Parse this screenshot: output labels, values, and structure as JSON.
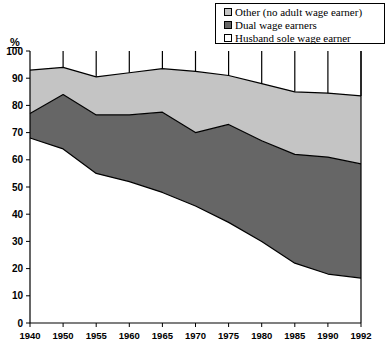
{
  "chart_data": {
    "type": "area",
    "stacked": true,
    "title": "",
    "xlabel": "",
    "ylabel": "%",
    "ylim": [
      0,
      100
    ],
    "ytick_step": 10,
    "yticks": [
      0,
      10,
      20,
      30,
      40,
      50,
      60,
      70,
      80,
      90,
      100
    ],
    "grid": false,
    "legend_position": "top-right",
    "categories": [
      "1940",
      "1950",
      "1955",
      "1960",
      "1965",
      "1970",
      "1975",
      "1980",
      "1985",
      "1990",
      "1992"
    ],
    "series": [
      {
        "name": "Husband sole wage earner",
        "color": "#ffffff",
        "values": [
          68,
          64,
          55,
          52,
          48,
          43,
          37,
          30,
          22,
          18,
          16.5
        ]
      },
      {
        "name": "Dual wage earners",
        "color": "#666666",
        "values": [
          9,
          20,
          21.5,
          24.5,
          29.5,
          27,
          36,
          37,
          40,
          43,
          42
        ]
      },
      {
        "name": "Other (no adult wage earner)",
        "color": "#c4c4c4",
        "values": [
          16,
          10,
          14,
          15.5,
          16,
          22.5,
          18,
          21,
          23,
          23.5,
          25
        ]
      }
    ],
    "cumulative_tops": {
      "husband_sole": [
        68,
        64,
        55,
        52,
        48,
        43,
        37,
        30,
        22,
        18,
        16.5
      ],
      "dual_top": [
        77,
        84,
        76.5,
        76.5,
        77.5,
        70,
        73,
        67,
        62,
        61,
        58.5
      ],
      "total_top": [
        93,
        94,
        90.5,
        92,
        93.5,
        92.5,
        91,
        88,
        85,
        84.5,
        83.5
      ]
    }
  },
  "legend": {
    "items": [
      {
        "label": "Other (no adult wage earner)",
        "swatch": "#c4c4c4"
      },
      {
        "label": "Dual wage earners",
        "swatch": "#666666"
      },
      {
        "label": "Husband sole wage earner",
        "swatch": "#ffffff"
      }
    ]
  },
  "axes": {
    "y_title": "%",
    "y_labels": [
      "100",
      "90",
      "80",
      "70",
      "60",
      "50",
      "40",
      "30",
      "20",
      "10",
      "0"
    ],
    "x_labels": [
      "1940",
      "1950",
      "1955",
      "1960",
      "1965",
      "1970",
      "1975",
      "1980",
      "1985",
      "1990",
      "1992"
    ]
  },
  "colors": {
    "other": "#c4c4c4",
    "dual": "#666666",
    "husband": "#ffffff",
    "axis": "#000000",
    "background": "#ffffff"
  }
}
